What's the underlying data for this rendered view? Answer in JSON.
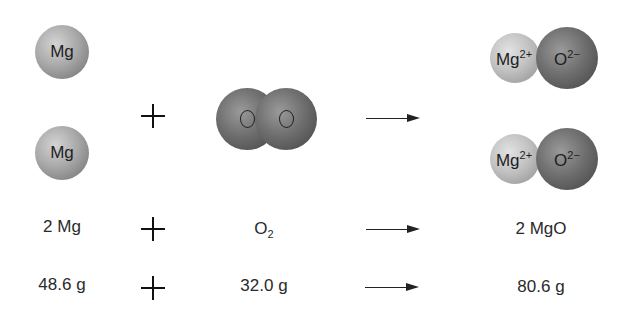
{
  "reactants": {
    "mg_atoms": [
      {
        "label": "Mg"
      },
      {
        "label": "Mg"
      }
    ],
    "o2_molecule": {
      "atoms": [
        {
          "label": "O"
        },
        {
          "label": "O"
        }
      ]
    }
  },
  "products": {
    "mgo_pairs": [
      {
        "cation": "Mg",
        "cation_charge": "2+",
        "anion": "O",
        "anion_charge": "2−"
      },
      {
        "cation": "Mg",
        "cation_charge": "2+",
        "anion": "O",
        "anion_charge": "2−"
      }
    ]
  },
  "operators": {
    "plus": "+",
    "arrow": "→"
  },
  "formula_row": {
    "reactant1": "2 Mg",
    "reactant2_base": "O",
    "reactant2_sub": "2",
    "product": "2 MgO"
  },
  "mass_row": {
    "reactant1": "48.6 g",
    "reactant2": "32.0 g",
    "product": "80.6 g"
  },
  "colors": {
    "mg": "#a9a9a9",
    "mg_ion": "#c2c2c2",
    "oxygen": "#6f6f6f",
    "text": "#2a2a2a"
  }
}
